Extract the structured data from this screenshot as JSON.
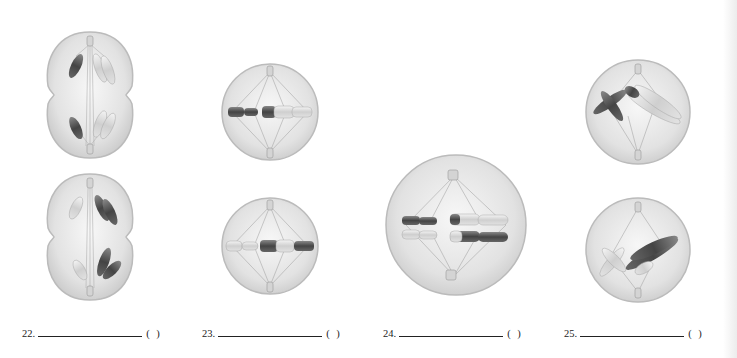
{
  "worksheet": {
    "questions": [
      {
        "number": "22.",
        "paren": "( )",
        "answer": "",
        "figures": [
          "dividing-cell-top",
          "dividing-cell-bottom"
        ]
      },
      {
        "number": "23.",
        "paren": "( )",
        "answer": "",
        "figures": [
          "metaphase-cell-top",
          "metaphase-cell-bottom"
        ]
      },
      {
        "number": "24.",
        "paren": "( )",
        "answer": "",
        "figures": [
          "metaphase-paired-cell"
        ]
      },
      {
        "number": "25.",
        "paren": "( )",
        "answer": "",
        "figures": [
          "prometaphase-cell-top",
          "prometaphase-cell-bottom"
        ]
      }
    ]
  },
  "colors": {
    "cell_fill": "#e8e8e8",
    "cell_rim": "#bdbdbd",
    "dark_chromosome": "#555555",
    "light_chromosome": "#dcdcdc",
    "spindle": "#a8a8a8",
    "text": "#222222"
  }
}
